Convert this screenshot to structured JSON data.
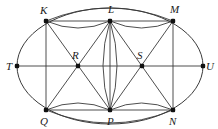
{
  "figure": {
    "background_color": "#ffffff",
    "stroke_color": "#3a3a3a",
    "dot_color": "#111111",
    "label_color": "#1a1a1a",
    "canvas": {
      "width": 218,
      "height": 129
    },
    "ellipse": {
      "cx": 110,
      "cy": 66,
      "rx": 93,
      "ry": 58
    },
    "points": [
      {
        "id": "K",
        "label": "K",
        "x": 46,
        "y": 21,
        "label_x": 40,
        "label_y": 14,
        "dot": true,
        "role": "top-left-vertex"
      },
      {
        "id": "L",
        "label": "L",
        "x": 110,
        "y": 21,
        "label_x": 108,
        "label_y": 13,
        "dot": true,
        "role": "top-center-vertex"
      },
      {
        "id": "M",
        "label": "M",
        "x": 173,
        "y": 21,
        "label_x": 170,
        "label_y": 13,
        "dot": true,
        "role": "top-right-vertex"
      },
      {
        "id": "T",
        "label": "T",
        "x": 17,
        "y": 66,
        "label_x": 6,
        "label_y": 70,
        "dot": true,
        "role": "left-axis-endpoint"
      },
      {
        "id": "R",
        "label": "R",
        "x": 78,
        "y": 66,
        "label_x": 72,
        "label_y": 59,
        "dot": true,
        "role": "left-interior-node"
      },
      {
        "id": "S",
        "label": "S",
        "x": 142,
        "y": 66,
        "label_x": 137,
        "label_y": 59,
        "dot": true,
        "role": "right-interior-node"
      },
      {
        "id": "U",
        "label": "U",
        "x": 203,
        "y": 66,
        "label_x": 206,
        "label_y": 70,
        "dot": true,
        "role": "right-axis-endpoint"
      },
      {
        "id": "Q",
        "label": "Q",
        "x": 46,
        "y": 110,
        "label_x": 40,
        "label_y": 125,
        "dot": true,
        "role": "bottom-left-vertex"
      },
      {
        "id": "P",
        "label": "P",
        "x": 110,
        "y": 110,
        "label_x": 107,
        "label_y": 125,
        "dot": true,
        "role": "bottom-center-vertex"
      },
      {
        "id": "N",
        "label": "N",
        "x": 173,
        "y": 110,
        "label_x": 169,
        "label_y": 125,
        "dot": true,
        "role": "bottom-right-vertex"
      }
    ],
    "straight_edges": [
      {
        "from": "T",
        "to": "U",
        "name": "horizontal-axis-T-U"
      },
      {
        "from": "K",
        "to": "L",
        "name": "edge-K-L"
      },
      {
        "from": "L",
        "to": "M",
        "name": "edge-L-M"
      },
      {
        "from": "Q",
        "to": "P",
        "name": "edge-Q-P"
      },
      {
        "from": "P",
        "to": "N",
        "name": "edge-P-N"
      },
      {
        "from": "K",
        "to": "Q",
        "name": "edge-K-Q-vertical"
      },
      {
        "from": "L",
        "to": "P",
        "name": "edge-L-P-vertical"
      },
      {
        "from": "M",
        "to": "N",
        "name": "edge-M-N-vertical"
      },
      {
        "from": "K",
        "to": "P",
        "name": "diagonal-K-P"
      },
      {
        "from": "L",
        "to": "Q",
        "name": "diagonal-L-Q"
      },
      {
        "from": "L",
        "to": "N",
        "name": "diagonal-L-N"
      },
      {
        "from": "M",
        "to": "P",
        "name": "diagonal-M-P"
      }
    ],
    "arc_edges": [
      {
        "from": "K",
        "to": "M",
        "name": "arc-K-M-upper",
        "sweep": "up",
        "bulge": 13
      },
      {
        "from": "K",
        "to": "L",
        "name": "arc-K-L-lower",
        "sweep": "down",
        "bulge": 7
      },
      {
        "from": "L",
        "to": "M",
        "name": "arc-L-M-lower",
        "sweep": "down",
        "bulge": 7
      },
      {
        "from": "Q",
        "to": "N",
        "name": "arc-Q-N-lower",
        "sweep": "down",
        "bulge": 13
      },
      {
        "from": "Q",
        "to": "P",
        "name": "arc-Q-P-upper",
        "sweep": "up",
        "bulge": 7
      },
      {
        "from": "P",
        "to": "N",
        "name": "arc-P-N-upper",
        "sweep": "up",
        "bulge": 7
      },
      {
        "from": "L",
        "to": "P",
        "name": "arc-L-P-left",
        "sweep": "left",
        "bulge": 7
      },
      {
        "from": "L",
        "to": "P",
        "name": "arc-L-P-right",
        "sweep": "right",
        "bulge": 7
      }
    ]
  }
}
